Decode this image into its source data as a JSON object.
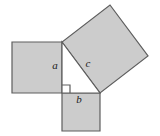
{
  "figure": {
    "width": 160,
    "height": 136,
    "background_color": "#ffffff",
    "fill_color": "#cccccc",
    "stroke_color": "#5e5e5e",
    "label_color": "#1a1a1a",
    "stroke_width": 1.2,
    "label_font_size": 11
  },
  "triangle": {
    "name": "right-triangle",
    "fill_color": "#ffffff",
    "vertices": [
      {
        "name": "apex",
        "x": 62,
        "y": 42
      },
      {
        "name": "right-angle-corner",
        "x": 62,
        "y": 93
      },
      {
        "name": "base-right",
        "x": 100,
        "y": 93
      }
    ],
    "points": "62,42 62,93 100,93",
    "right_angle_marker": {
      "name": "right-angle-marker",
      "points": "62,85 70,85 70,93",
      "size": 8
    }
  },
  "squares": [
    {
      "id": "square-a",
      "label": "a",
      "side": "vertical leg",
      "points": "62,42 12,42 12,93 62,93",
      "label_x": 55,
      "label_y": 66
    },
    {
      "id": "square-b",
      "label": "b",
      "side": "horizontal leg",
      "points": "62,93 100,93 100,131 62,131",
      "label_x": 79,
      "label_y": 100
    },
    {
      "id": "square-c",
      "label": "c",
      "side": "hypotenuse",
      "points": "62,42 100,93 148,56 110,5",
      "label_x": 88,
      "label_y": 64
    }
  ]
}
